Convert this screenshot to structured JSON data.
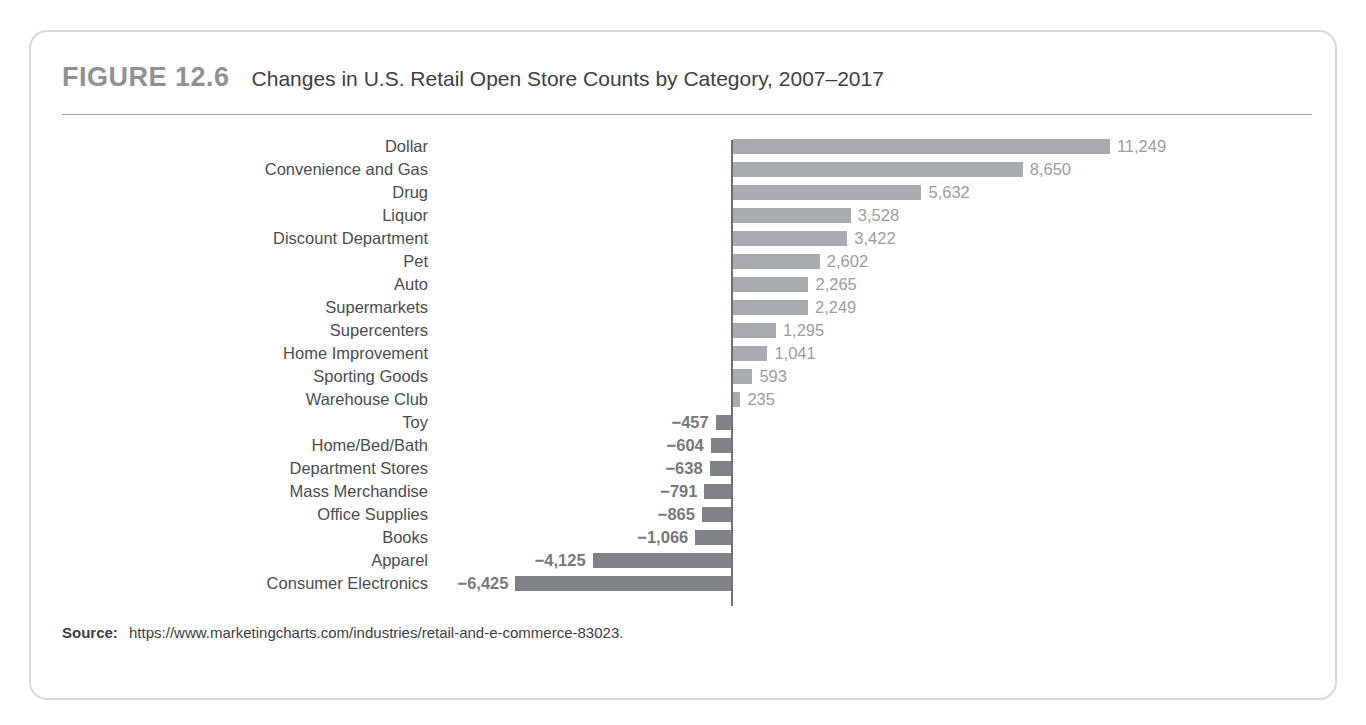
{
  "figure": {
    "number": "FIGURE 12.6",
    "title": "Changes in U.S. Retail Open Store Counts by Category, 2007–2017",
    "source_label": "Source:",
    "source_url": "https://www.marketingcharts.com/industries/retail-and-e-commerce-83023."
  },
  "colors": {
    "positive_bar": "#a9acaf",
    "negative_bar": "#808386",
    "axis": "#6e7174",
    "card_border": "#d7d9db",
    "figure_number": "#8f9295",
    "category_label": "#4a4d50",
    "positive_value_label": "#9b9ea1",
    "negative_value_label": "#76797c"
  },
  "chart_data": {
    "type": "bar",
    "orientation": "horizontal",
    "title": "Changes in U.S. Retail Open Store Counts by Category, 2007–2017",
    "xlabel": "",
    "ylabel": "",
    "grid": false,
    "legend": null,
    "axis_zero": 0,
    "xlim": [
      -6425,
      11249
    ],
    "categories": [
      "Dollar",
      "Convenience and Gas",
      "Drug",
      "Liquor",
      "Discount Department",
      "Pet",
      "Auto",
      "Supermarkets",
      "Supercenters",
      "Home Improvement",
      "Sporting Goods",
      "Warehouse Club",
      "Toy",
      "Home/Bed/Bath",
      "Department Stores",
      "Mass Merchandise",
      "Office Supplies",
      "Books",
      "Apparel",
      "Consumer Electronics"
    ],
    "values": [
      11249,
      8650,
      5632,
      3528,
      3422,
      2602,
      2265,
      2249,
      1295,
      1041,
      593,
      235,
      -457,
      -604,
      -638,
      -791,
      -865,
      -1066,
      -4125,
      -6425
    ],
    "value_labels": [
      "11,249",
      "8,650",
      "5,632",
      "3,528",
      "3,422",
      "2,602",
      "2,265",
      "2,249",
      "1,295",
      "1,041",
      "593",
      "235",
      "−457",
      "−604",
      "−638",
      "−791",
      "−865",
      "−1,066",
      "−4,125",
      "−6,425"
    ]
  }
}
